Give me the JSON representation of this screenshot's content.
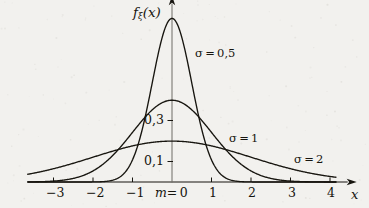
{
  "chart_data": {
    "type": "line",
    "title": "",
    "xlabel": "x",
    "ylabel": "f_xi(x)",
    "ylabel_base": "f",
    "ylabel_sub": "ξ",
    "ylabel_arg": "(x)",
    "grid": false,
    "legend_position": "inline-annotations",
    "xlim": [
      -3.55,
      4.6
    ],
    "ylim": [
      0,
      0.86
    ],
    "xticks": [
      -3,
      -2,
      -1,
      0,
      1,
      2,
      3,
      4
    ],
    "xticklabels": [
      "−3",
      "−2",
      "−1",
      "m = 0",
      "1",
      "2",
      "3",
      "4"
    ],
    "yticks": [
      0.1,
      0.3
    ],
    "yticklabels": [
      "0,1",
      "0,3"
    ],
    "mean_label": "m = 0",
    "mean_value": 0,
    "series": [
      {
        "name": "σ = 0,5",
        "sigma": 0.5,
        "mu": 0,
        "peak": 0.798,
        "color": "#17150f",
        "label_x": 1.05,
        "label_y": 0.645
      },
      {
        "name": "σ = 1",
        "sigma": 1,
        "mu": 0,
        "peak": 0.399,
        "color": "#17150f",
        "label_x": 1.85,
        "label_y": 0.228
      },
      {
        "name": "σ = 2",
        "sigma": 2,
        "mu": 0,
        "peak": 0.199,
        "color": "#17150f",
        "label_x": 3.52,
        "label_y": 0.108
      }
    ],
    "formula": "gaussian density",
    "axis_color": "#17150f",
    "background": "#f2f1ee"
  },
  "labels": {
    "y_axis_f": "f",
    "y_axis_sub": "ξ",
    "y_axis_paren": "(x)",
    "x_axis": "x",
    "y_tick_03": "0,3",
    "y_tick_01": "0,1",
    "x_tick_m3": "−3",
    "x_tick_m2": "−2",
    "x_tick_m1": "−1",
    "x_tick_origin_m": "m",
    "x_tick_origin_eq": "= 0",
    "x_tick_1": "1",
    "x_tick_2": "2",
    "x_tick_3": "3",
    "x_tick_4": "4",
    "curve_1": "σ = 0,5",
    "curve_2": "σ = 1",
    "curve_3": "σ = 2"
  }
}
